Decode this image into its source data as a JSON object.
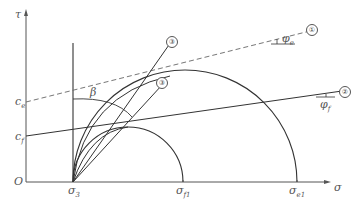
{
  "diagram": {
    "type": "mohr-coulomb-envelope",
    "axes": {
      "x_label": "σ",
      "y_label": "τ",
      "origin_label": "O"
    },
    "x_ticks": [
      {
        "id": "sigma3",
        "base": "σ",
        "sub": "3"
      },
      {
        "id": "sigma_f1",
        "base": "σ",
        "sub": "f1"
      },
      {
        "id": "sigma_e1",
        "base": "σ",
        "sub": "e1"
      }
    ],
    "y_ticks": [
      {
        "id": "c_e",
        "base": "c",
        "sub": "e"
      },
      {
        "id": "c_f",
        "base": "c",
        "sub": "f"
      }
    ],
    "lines": [
      {
        "id": "line-1",
        "marker": "①",
        "style": "dashed",
        "angle_base": "φ",
        "angle_sub": "e"
      },
      {
        "id": "line-2",
        "marker": "②",
        "style": "solid",
        "angle_base": "φ",
        "angle_sub": "f"
      },
      {
        "id": "line-3a",
        "marker": "③",
        "style": "solid"
      },
      {
        "id": "line-3b",
        "marker": "③",
        "style": "solid"
      }
    ],
    "angle_label": "β",
    "circles": [
      {
        "id": "large-mohr-circle",
        "from": "σ3",
        "to": "σe1"
      },
      {
        "id": "small-mohr-circle",
        "from": "σ3",
        "to": "σf1"
      }
    ]
  }
}
